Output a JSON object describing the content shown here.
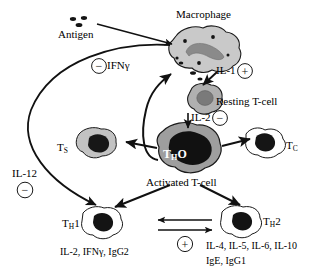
{
  "diagram": {
    "type": "biological-pathway-schematic",
    "colors": {
      "stroke": "#1a1a1a",
      "macrophage_body": "#c9c9c9",
      "macrophage_nucleus": "#8a8a8a",
      "resting_tcell_body": "#b0b0b0",
      "resting_tcell_nucleus": "#7a7a7a",
      "tho_body": "#9e9e9e",
      "tho_nucleus": "#111111",
      "ts_body": "#c2c2c2",
      "ts_nucleus": "#171717",
      "tc_body": "#ffffff",
      "tc_nucleus": "#151515",
      "th_body": "#ffffff",
      "th_nucleus": "#141414",
      "background": "#ffffff"
    }
  },
  "labels": {
    "antigen": "Antigen",
    "macrophage": "Macrophage",
    "ifn_gamma": "IFNγ",
    "il_1": "IL-1",
    "resting_tcell": "Resting T-cell",
    "il_2": "IL-2",
    "t_suppressor": "T",
    "t_suppressor_sub": "S",
    "t_cytotoxic": "T",
    "t_cytotoxic_sub": "C",
    "tho": "T",
    "tho_sub": "H",
    "tho_suffix": "O",
    "activated_tcell": "Activated T-cell",
    "il_12": "IL-12",
    "th1": "T",
    "th1_sub": "H",
    "th1_suffix": "1",
    "th2": "T",
    "th2_sub": "H",
    "th2_suffix": "2",
    "th1_cytokines": "IL-2, IFNγ, IgG2",
    "th2_cytokines_line1": "IL-4, IL-5, IL-6, IL-10",
    "th2_cytokines_line2": "IgE, IgG1"
  },
  "signs": {
    "ifn_gamma_sign": "−",
    "il_1_sign": "+",
    "il_2_sign": "−",
    "il_12_sign": "−",
    "th_crosstalk_sign": "+"
  },
  "cells": [
    {
      "name": "macrophage",
      "label": "Macrophage",
      "kind": "antigen-presenting-cell"
    },
    {
      "name": "resting-tcell",
      "label": "Resting T-cell",
      "kind": "t-lymphocyte"
    },
    {
      "name": "tho-cell",
      "label": "Activated T-cell",
      "kind": "t-helper-precursor"
    },
    {
      "name": "ts-cell",
      "label": "TS",
      "kind": "suppressor-t-cell"
    },
    {
      "name": "tc-cell",
      "label": "TC",
      "kind": "cytotoxic-t-cell"
    },
    {
      "name": "th1-cell",
      "label": "TH1",
      "kind": "t-helper-1"
    },
    {
      "name": "th2-cell",
      "label": "TH2",
      "kind": "t-helper-2"
    }
  ],
  "arrows": [
    {
      "from": "antigen",
      "to": "macrophage",
      "mediator": ""
    },
    {
      "from": "macrophage",
      "to": "resting-tcell",
      "mediator": "IL-1"
    },
    {
      "from": "resting-tcell",
      "to": "tho-cell",
      "mediator": "IL-2"
    },
    {
      "from": "tho-cell",
      "to": "ts-cell",
      "mediator": ""
    },
    {
      "from": "tho-cell",
      "to": "tc-cell",
      "mediator": ""
    },
    {
      "from": "tho-cell",
      "to": "th1-cell",
      "mediator": ""
    },
    {
      "from": "tho-cell",
      "to": "th2-cell",
      "mediator": ""
    },
    {
      "from": "tho-cell",
      "to": "macrophage",
      "mediator": "IFNγ"
    },
    {
      "from": "macrophage",
      "to": "th1-cell",
      "mediator": "IL-12"
    },
    {
      "from": "th1-cell",
      "to": "th2-cell",
      "mediator": "crosstalk"
    },
    {
      "from": "th2-cell",
      "to": "th1-cell",
      "mediator": "crosstalk"
    }
  ]
}
